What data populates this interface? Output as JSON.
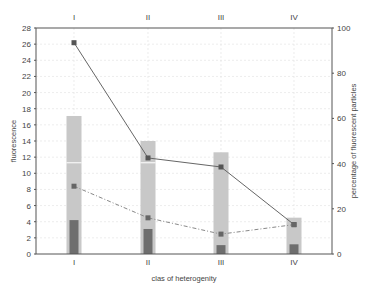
{
  "chart_data": {
    "type": "bar",
    "title": "",
    "xlabel": "clas of heterogenity",
    "ylabel": "fluorescence",
    "y2label": "percentage of fluorescent particles",
    "categories": [
      "I",
      "II",
      "III",
      "IV"
    ],
    "top_tick_labels": [
      "I",
      "II",
      "III",
      "IV"
    ],
    "ylim": [
      0,
      28
    ],
    "y2lim": [
      0,
      100
    ],
    "yticks": [
      0,
      2,
      4,
      6,
      8,
      10,
      12,
      14,
      16,
      18,
      20,
      22,
      24,
      26,
      28
    ],
    "y2ticks": [
      0,
      20,
      40,
      60,
      80,
      100
    ],
    "grid": true,
    "legend": null,
    "series": [
      {
        "name": "fluorescence (light bar)",
        "type": "bar",
        "axis": "left",
        "color": "#c8c8c8",
        "values": [
          17.1,
          14.0,
          12.6,
          4.5
        ]
      },
      {
        "name": "fluorescence (dark bar)",
        "type": "bar",
        "axis": "left",
        "color": "#6e6e6e",
        "values": [
          4.2,
          3.1,
          1.1,
          1.2
        ]
      },
      {
        "name": "percentage (solid line)",
        "type": "line",
        "axis": "right",
        "color": "#666666",
        "style": "solid",
        "values": [
          93.5,
          42.5,
          38.5,
          13.0
        ]
      },
      {
        "name": "percentage (dashed line)",
        "type": "line",
        "axis": "right",
        "color": "#888888",
        "style": "dashdot",
        "values": [
          30.0,
          16.0,
          8.8,
          13.0
        ]
      }
    ],
    "annotations": [
      {
        "type": "white-line-on-bar",
        "categories": [
          "I",
          "II"
        ],
        "value": 11.3
      }
    ]
  }
}
